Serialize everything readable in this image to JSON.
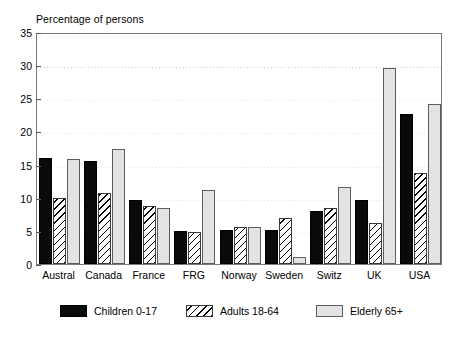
{
  "chart_data": {
    "type": "bar",
    "title": "Percentage of persons",
    "xlabel": "",
    "ylabel": "",
    "ylim": [
      0,
      35
    ],
    "yticks": [
      0,
      5,
      10,
      15,
      20,
      25,
      30,
      35
    ],
    "grid": true,
    "legend_position": "bottom",
    "categories": [
      "Austral",
      "Canada",
      "France",
      "FRG",
      "Norway",
      "Sweden",
      "Switz",
      "UK",
      "USA"
    ],
    "series": [
      {
        "name": "Children 0-17",
        "style": "solid-black",
        "color": "#0a0a0a",
        "values": [
          16.0,
          15.5,
          9.6,
          5.0,
          5.2,
          5.2,
          8.0,
          9.6,
          22.6
        ]
      },
      {
        "name": "Adults 18-64",
        "style": "hatched",
        "color": "#ffffff",
        "values": [
          10.0,
          10.7,
          8.8,
          4.8,
          5.6,
          7.0,
          8.5,
          6.2,
          13.8
        ]
      },
      {
        "name": "Elderly 65+",
        "style": "light-gray",
        "color": "#e3e3e3",
        "values": [
          15.8,
          17.4,
          8.4,
          11.2,
          5.6,
          1.1,
          11.6,
          29.6,
          24.2
        ]
      }
    ]
  },
  "legend": {
    "items": [
      {
        "label": "Children 0-17",
        "swatch": "children"
      },
      {
        "label": "Adults 18-64",
        "swatch": "adults"
      },
      {
        "label": "Elderly 65+",
        "swatch": "elderly"
      }
    ]
  }
}
